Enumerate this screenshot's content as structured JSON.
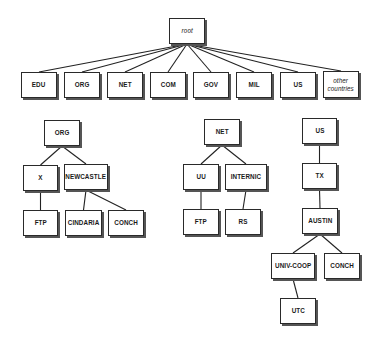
{
  "diagram": {
    "type": "tree",
    "title": "",
    "nodes": [
      {
        "id": "root",
        "label": "root",
        "italic": true,
        "x": 169,
        "y": 18,
        "w": 36,
        "h": 26
      },
      {
        "id": "edu",
        "label": "EDU",
        "x": 21,
        "y": 72,
        "w": 36,
        "h": 26
      },
      {
        "id": "org",
        "label": "ORG",
        "x": 64,
        "y": 72,
        "w": 36,
        "h": 26
      },
      {
        "id": "net",
        "label": "NET",
        "x": 107,
        "y": 72,
        "w": 36,
        "h": 26
      },
      {
        "id": "com",
        "label": "COM",
        "x": 150,
        "y": 72,
        "w": 36,
        "h": 26
      },
      {
        "id": "gov",
        "label": "GOV",
        "x": 193,
        "y": 72,
        "w": 36,
        "h": 26
      },
      {
        "id": "mil",
        "label": "MIL",
        "x": 236,
        "y": 72,
        "w": 36,
        "h": 26
      },
      {
        "id": "us",
        "label": "US",
        "x": 280,
        "y": 72,
        "w": 36,
        "h": 26
      },
      {
        "id": "other",
        "label": "other\ncountries",
        "italic": true,
        "x": 323,
        "y": 71,
        "w": 36,
        "h": 27
      },
      {
        "id": "org2",
        "label": "ORG",
        "x": 44,
        "y": 120,
        "w": 36,
        "h": 26
      },
      {
        "id": "x",
        "label": "X",
        "x": 23,
        "y": 165,
        "w": 35,
        "h": 26
      },
      {
        "id": "newcastle",
        "label": "NEWCASTLE",
        "x": 64,
        "y": 164,
        "w": 44,
        "h": 26
      },
      {
        "id": "ftp1",
        "label": "FTP",
        "x": 23,
        "y": 210,
        "w": 35,
        "h": 26
      },
      {
        "id": "cindaria",
        "label": "CINDARIA",
        "x": 65,
        "y": 210,
        "w": 37,
        "h": 26
      },
      {
        "id": "conch1",
        "label": "CONCH",
        "x": 108,
        "y": 210,
        "w": 36,
        "h": 26
      },
      {
        "id": "net2",
        "label": "NET",
        "x": 204,
        "y": 119,
        "w": 36,
        "h": 26
      },
      {
        "id": "uu",
        "label": "UU",
        "x": 183,
        "y": 164,
        "w": 36,
        "h": 26
      },
      {
        "id": "internic",
        "label": "INTERNIC",
        "x": 225,
        "y": 164,
        "w": 42,
        "h": 26
      },
      {
        "id": "ftp2",
        "label": "FTP",
        "x": 183,
        "y": 209,
        "w": 36,
        "h": 26
      },
      {
        "id": "rs",
        "label": "RS",
        "x": 225,
        "y": 209,
        "w": 36,
        "h": 26
      },
      {
        "id": "us2",
        "label": "US",
        "x": 302,
        "y": 118,
        "w": 35,
        "h": 26
      },
      {
        "id": "tx",
        "label": "TX",
        "x": 302,
        "y": 163,
        "w": 35,
        "h": 26
      },
      {
        "id": "austin",
        "label": "AUSTIN",
        "x": 302,
        "y": 208,
        "w": 36,
        "h": 26
      },
      {
        "id": "univcoop",
        "label": "UNIV-COOP",
        "x": 271,
        "y": 253,
        "w": 44,
        "h": 26
      },
      {
        "id": "conch2",
        "label": "CONCH",
        "x": 324,
        "y": 253,
        "w": 36,
        "h": 26
      },
      {
        "id": "utc",
        "label": "UTC",
        "x": 280,
        "y": 298,
        "w": 36,
        "h": 26
      }
    ],
    "edges": [
      [
        "root",
        "edu"
      ],
      [
        "root",
        "org"
      ],
      [
        "root",
        "net"
      ],
      [
        "root",
        "com"
      ],
      [
        "root",
        "gov"
      ],
      [
        "root",
        "mil"
      ],
      [
        "root",
        "us"
      ],
      [
        "root",
        "other"
      ],
      [
        "org2",
        "x"
      ],
      [
        "org2",
        "newcastle"
      ],
      [
        "x",
        "ftp1"
      ],
      [
        "newcastle",
        "cindaria"
      ],
      [
        "newcastle",
        "conch1"
      ],
      [
        "net2",
        "uu"
      ],
      [
        "net2",
        "internic"
      ],
      [
        "uu",
        "ftp2"
      ],
      [
        "internic",
        "rs"
      ],
      [
        "us2",
        "tx"
      ],
      [
        "tx",
        "austin"
      ],
      [
        "austin",
        "univcoop"
      ],
      [
        "austin",
        "conch2"
      ],
      [
        "univcoop",
        "utc"
      ]
    ],
    "colors": {
      "stroke": "#222222",
      "fill": "#ffffff",
      "shadow": "#555555",
      "text": "#1a1a1a"
    }
  }
}
